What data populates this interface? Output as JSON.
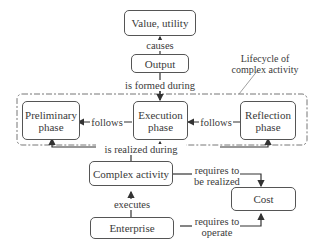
{
  "nodes": {
    "value": "Value, utility",
    "output": "Output",
    "preliminary": "Preliminary phase",
    "execution": "Execution phase",
    "reflection": "Reflection phase",
    "complex_activity": "Complex activity",
    "cost": "Cost",
    "enterprise": "Enterprise"
  },
  "edges": {
    "causes": "causes",
    "formed_during": "is formed during",
    "follows_left": "follows",
    "follows_right": "follows",
    "realized_during": "is realized during",
    "executes": "executes",
    "req_realized_1": "requires to",
    "req_realized_2": "be realized",
    "req_operate_1": "requires to",
    "req_operate_2": "operate"
  },
  "group": {
    "label_1": "Lifecycle of",
    "label_2": "complex activity"
  }
}
